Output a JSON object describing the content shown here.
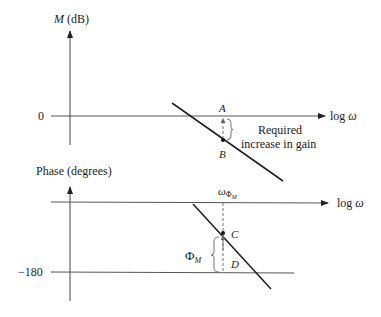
{
  "magnitude_plot": {
    "y_axis_label_var": "M",
    "y_axis_label_unit": " (dB)",
    "zero_tick": "0",
    "x_axis_label_prefix": "log ",
    "x_axis_label_var": "ω",
    "point_a": "A",
    "point_b": "B",
    "annotation_line1": "Required",
    "annotation_line2": "increase in gain"
  },
  "phase_plot": {
    "y_axis_label": "Phase (degrees)",
    "neg180_tick": "−180",
    "x_axis_label_prefix": "log ",
    "x_axis_label_var": "ω",
    "freq_label_var": "ω",
    "freq_label_sub": "Φ",
    "freq_label_subsub": "M",
    "margin_label_var": "Φ",
    "margin_label_sub": "M",
    "point_c": "C",
    "point_d": "D"
  },
  "colors": {
    "line": "#222222",
    "axis": "#555555",
    "dashed": "#777777"
  }
}
